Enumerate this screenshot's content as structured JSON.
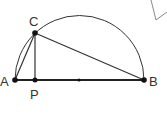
{
  "diagram": {
    "colors": {
      "line": "#333333",
      "corner_shape": "#888888",
      "background": "#ffffff"
    },
    "points": {
      "A": {
        "label": "A",
        "x": 15,
        "y": 80
      },
      "P": {
        "label": "P",
        "x": 35,
        "y": 80
      },
      "O": {
        "label": "",
        "x": 79,
        "y": 80
      },
      "B": {
        "label": "B",
        "x": 144,
        "y": 80
      },
      "C": {
        "label": "C",
        "x": 35,
        "y": 33
      }
    },
    "segments": [
      "AB",
      "AC",
      "CB",
      "CP"
    ],
    "arc": "semicircle over AB"
  }
}
